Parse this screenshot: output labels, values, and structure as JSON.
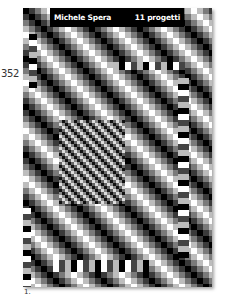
{
  "page": {
    "page_number": "352",
    "caption": "1."
  },
  "poster": {
    "author": "Michele Spera",
    "title": "11 progetti",
    "banner_color": "#000000",
    "banner_text_color": "#ffffff",
    "pattern": "diagonal grey-scale checkerboard op-art"
  }
}
